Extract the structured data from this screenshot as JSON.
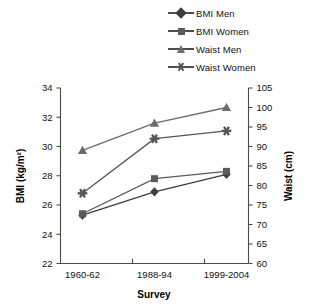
{
  "chart_data": {
    "type": "line",
    "title": "",
    "xlabel": "Survey",
    "ylabel": "BMI (kg/m²)",
    "y2label": "Waist (cm)",
    "categories": [
      "1960-62",
      "1988-94",
      "1999-2004"
    ],
    "ylim": [
      22,
      34
    ],
    "yticks": [
      22,
      24,
      26,
      28,
      30,
      32,
      34
    ],
    "y2lim": [
      60,
      105
    ],
    "y2ticks": [
      60,
      65,
      70,
      75,
      80,
      85,
      90,
      95,
      100,
      105
    ],
    "grid": false,
    "legend_position": "top-right",
    "series": [
      {
        "name": "BMI Men",
        "axis": "left",
        "marker": "diamond",
        "color": "#3d3d3d",
        "values": [
          25.3,
          26.9,
          28.1
        ]
      },
      {
        "name": "BMI Women",
        "axis": "left",
        "marker": "square",
        "color": "#5a5a5a",
        "values": [
          25.4,
          27.8,
          28.3
        ]
      },
      {
        "name": "Waist Men",
        "axis": "right",
        "marker": "triangle",
        "color": "#6b6b6b",
        "values": [
          89,
          96,
          100
        ]
      },
      {
        "name": "Waist Women",
        "axis": "right",
        "marker": "star",
        "color": "#555555",
        "values": [
          78,
          92,
          94
        ]
      }
    ]
  },
  "legend": {
    "items": [
      {
        "label": "BMI Men"
      },
      {
        "label": "BMI Women"
      },
      {
        "label": "Waist Men"
      },
      {
        "label": "Waist Women"
      }
    ]
  },
  "axes": {
    "left": {
      "title": "BMI (kg/m²)",
      "labels": [
        "34",
        "32",
        "30",
        "28",
        "26",
        "24",
        "22"
      ]
    },
    "right": {
      "title": "Waist (cm)",
      "labels": [
        "105",
        "100",
        "95",
        "90",
        "85",
        "80",
        "75",
        "70",
        "65",
        "60"
      ]
    },
    "bottom": {
      "title": "Survey",
      "labels": [
        "1960-62",
        "1988-94",
        "1999-2004"
      ]
    }
  }
}
